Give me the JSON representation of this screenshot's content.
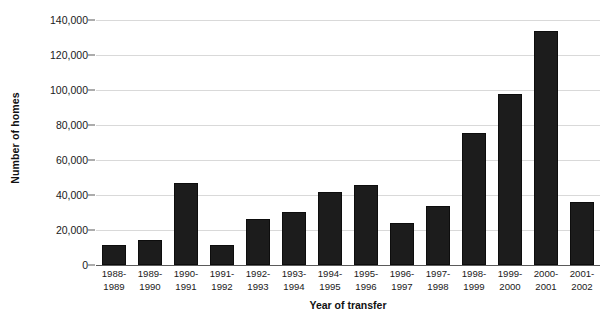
{
  "chart_data": {
    "type": "bar",
    "title": "",
    "xlabel": "Year of transfer",
    "ylabel": "Number of homes",
    "categories": [
      "1988-1989",
      "1989-1990",
      "1990-1991",
      "1991-1992",
      "1992-1993",
      "1993-1994",
      "1994-1995",
      "1995-1996",
      "1996-1997",
      "1997-1998",
      "1998-1999",
      "1999-2000",
      "2000-2001",
      "2001-2002"
    ],
    "category_lines": [
      [
        "1988-",
        "1989"
      ],
      [
        "1989-",
        "1990"
      ],
      [
        "1990-",
        "1991"
      ],
      [
        "1991-",
        "1992"
      ],
      [
        "1992-",
        "1993"
      ],
      [
        "1993-",
        "1994"
      ],
      [
        "1994-",
        "1995"
      ],
      [
        "1995-",
        "1996"
      ],
      [
        "1996-",
        "1997"
      ],
      [
        "1997-",
        "1998"
      ],
      [
        "1998-",
        "1999"
      ],
      [
        "1999-",
        "2000"
      ],
      [
        "2000-",
        "2001"
      ],
      [
        "2001-",
        "2002"
      ]
    ],
    "values": [
      11500,
      14500,
      47000,
      11500,
      26500,
      30500,
      41500,
      45500,
      24000,
      33500,
      75500,
      98000,
      134000,
      36000
    ],
    "ylim": [
      0,
      140000
    ],
    "ytick_values": [
      0,
      20000,
      40000,
      60000,
      80000,
      100000,
      120000,
      140000
    ],
    "ytick_labels": [
      "0",
      "20,000",
      "40,000",
      "60,000",
      "80,000",
      "100,000",
      "120,000",
      "140,000"
    ],
    "grid": true,
    "legend": false,
    "bar_color": "#1c1c1c",
    "gridline_color": "#d9d9d9",
    "axis_color": "#5a5a5a"
  }
}
